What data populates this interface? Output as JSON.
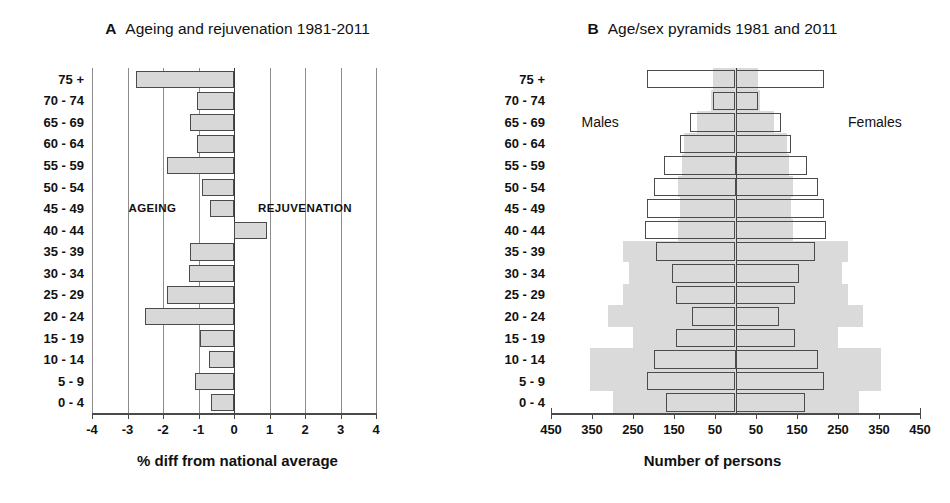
{
  "figure": {
    "panels": [
      {
        "letter": "A",
        "title": "Ageing and rejuvenation 1981-2011",
        "xlabel": "% diff from national average",
        "annotation_left": "AGEING",
        "annotation_right": "REJUVENATION"
      },
      {
        "letter": "B",
        "title": "Age/sex pyramids 1981 and 2011",
        "xlabel": "Number of persons",
        "label_left": "Males",
        "label_right": "Females"
      }
    ]
  },
  "age_groups": [
    "75 +",
    "70 - 74",
    "65 - 69",
    "60 - 64",
    "55 - 59",
    "50 - 54",
    "45 - 49",
    "40 - 44",
    "35 - 39",
    "30 - 34",
    "25 - 29",
    "20 - 24",
    "15 - 19",
    "10 - 14",
    "5 - 9",
    "0 - 4"
  ],
  "chart_data": [
    {
      "type": "bar",
      "orientation": "horizontal",
      "title": "Ageing and rejuvenation 1981-2011",
      "panel_letter": "A",
      "xlabel": "% diff from national average",
      "ylabel": "",
      "xlim": [
        -4,
        4
      ],
      "xticks": [
        -4,
        -3,
        -2,
        -1,
        0,
        1,
        2,
        3,
        4
      ],
      "xtick_labels": [
        "-4",
        "-3",
        "-2",
        "-1",
        "0",
        "1",
        "2",
        "3",
        "4"
      ],
      "grid": true,
      "categories": [
        "75 +",
        "70 - 74",
        "65 - 69",
        "60 - 64",
        "55 - 59",
        "50 - 54",
        "45 - 49",
        "40 - 44",
        "35 - 39",
        "30 - 34",
        "25 - 29",
        "20 - 24",
        "15 - 19",
        "10 - 14",
        "5 - 9",
        "0 - 4"
      ],
      "values": [
        -2.76,
        -1.04,
        -1.24,
        -1.04,
        -1.88,
        -0.89,
        -0.69,
        0.93,
        -1.24,
        -1.28,
        -1.88,
        -2.51,
        -0.97,
        -0.71,
        -1.11,
        -0.64
      ],
      "annotations": [
        {
          "text": "AGEING",
          "x": -2.3,
          "category": "45 - 49"
        },
        {
          "text": "REJUVENATION",
          "x": 2.0,
          "category": "45 - 49"
        }
      ],
      "bar_fill": "#d8d8d8",
      "bar_stroke": "#4b4b4b"
    },
    {
      "type": "bar",
      "subtype": "population-pyramid",
      "title": "Age/sex pyramids 1981 and 2011",
      "panel_letter": "B",
      "xlabel": "Number of persons",
      "ylabel": "",
      "xlim": [
        -450,
        450
      ],
      "xticks": [
        -450,
        -350,
        -250,
        -150,
        -50,
        50,
        150,
        250,
        350,
        450
      ],
      "xtick_labels": [
        "450",
        "350",
        "250",
        "150",
        "50",
        "50",
        "150",
        "250",
        "350",
        "450"
      ],
      "grid": false,
      "categories": [
        "75 +",
        "70 - 74",
        "65 - 69",
        "60 - 64",
        "55 - 59",
        "50 - 54",
        "45 - 49",
        "40 - 44",
        "35 - 39",
        "30 - 34",
        "25 - 29",
        "20 - 24",
        "15 - 19",
        "10 - 14",
        "5 - 9",
        "0 - 4"
      ],
      "legend": [
        "Males",
        "Females"
      ],
      "legend_position": "inside-left-and-right",
      "series": [
        {
          "name": "1981 (shaded area)",
          "style": "filled-area",
          "fill": "#dadada",
          "males": [
            55,
            60,
            95,
            125,
            130,
            140,
            135,
            140,
            275,
            260,
            275,
            310,
            250,
            355,
            355,
            300
          ],
          "females": [
            55,
            60,
            95,
            125,
            130,
            140,
            135,
            140,
            275,
            260,
            275,
            310,
            250,
            355,
            355,
            300
          ]
        },
        {
          "name": "2011 (outlined bars)",
          "style": "outline",
          "stroke": "#4b4b4b",
          "males": [
            215,
            55,
            110,
            135,
            175,
            200,
            215,
            220,
            195,
            155,
            145,
            105,
            145,
            200,
            215,
            170
          ],
          "females": [
            215,
            55,
            110,
            135,
            175,
            200,
            215,
            220,
            195,
            155,
            145,
            105,
            145,
            200,
            215,
            170
          ]
        }
      ]
    }
  ]
}
